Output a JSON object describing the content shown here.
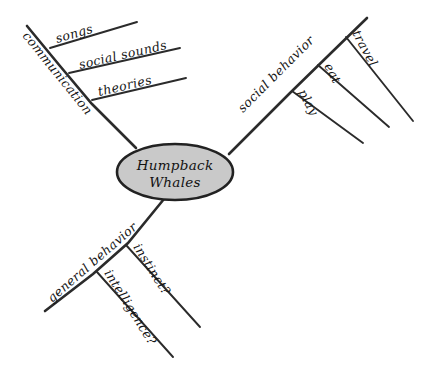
{
  "diagram": {
    "type": "mind-map",
    "background_color": "#ffffff",
    "ink_color": "#2b2b2b",
    "center": {
      "label_line_1": "Humpback",
      "label_line_2": "Whales",
      "fill_color": "#c9c9c9",
      "stroke_color": "#222222"
    },
    "branches": [
      {
        "id": "communication",
        "label": "communication",
        "direction": "upper-left",
        "children": [
          {
            "id": "songs",
            "label": "songs"
          },
          {
            "id": "social-sounds",
            "label": "social sounds"
          },
          {
            "id": "theories",
            "label": "theories"
          }
        ]
      },
      {
        "id": "social-behavior",
        "label": "social behavior",
        "direction": "upper-right",
        "children": [
          {
            "id": "play",
            "label": "play"
          },
          {
            "id": "eat",
            "label": "eat"
          },
          {
            "id": "travel",
            "label": "travel"
          }
        ]
      },
      {
        "id": "general-behavior",
        "label": "general behavior",
        "direction": "lower-left",
        "children": [
          {
            "id": "instinct",
            "label": "instinct?"
          },
          {
            "id": "intelligence",
            "label": "intelligence?"
          }
        ]
      }
    ]
  }
}
